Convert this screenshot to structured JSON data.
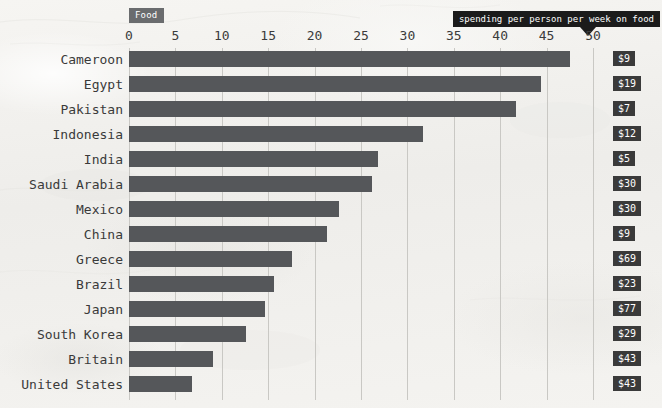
{
  "category_tag": "Food",
  "callout": {
    "text": "spending per person per week on food",
    "arrow_icon": "triangle-down-icon"
  },
  "colors": {
    "bar": "#55575a",
    "badge": "#3a3a3a",
    "tag": "#6a6c6e",
    "callout": "#1b1b1b",
    "gridline": "#c9c8c4",
    "background": "#f3f2ef"
  },
  "chart_data": {
    "type": "bar",
    "orientation": "horizontal",
    "title": "Food",
    "annotation": "spending per person per week on food",
    "xlabel": "",
    "ylabel": "",
    "xlim": [
      0,
      52
    ],
    "xticks": [
      0,
      5,
      10,
      15,
      20,
      25,
      30,
      35,
      40,
      45,
      50
    ],
    "xtick_labels": [
      "0",
      "5",
      "10",
      "15",
      "20",
      "25",
      "30",
      "35",
      "40",
      "45",
      "50"
    ],
    "grid": true,
    "grid_axis": "x",
    "legend": false,
    "categories": [
      "Cameroon",
      "Egypt",
      "Pakistan",
      "Indonesia",
      "India",
      "Saudi Arabia",
      "Mexico",
      "China",
      "Greece",
      "Brazil",
      "Japan",
      "South Korea",
      "Britain",
      "United States"
    ],
    "values": [
      47.5,
      44.4,
      41.7,
      31.7,
      26.8,
      26.2,
      22.6,
      21.3,
      17.6,
      15.6,
      14.7,
      12.6,
      9.1,
      6.8
    ],
    "value_labels": [
      "$9",
      "$19",
      "$7",
      "$12",
      "$5",
      "$30",
      "$30",
      "$9",
      "$69",
      "$23",
      "$77",
      "$29",
      "$43",
      "$43"
    ]
  }
}
